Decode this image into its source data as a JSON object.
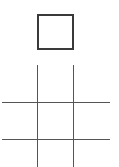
{
  "game": {
    "type": "tic-tac-toe",
    "current_player_indicator": {
      "shape": "square",
      "filled": false,
      "border_color": "#3a3a3a"
    },
    "board": {
      "line_color": "#555555",
      "cells": [
        [
          "",
          "",
          ""
        ],
        [
          "",
          "",
          ""
        ],
        [
          "",
          "",
          ""
        ]
      ]
    }
  }
}
